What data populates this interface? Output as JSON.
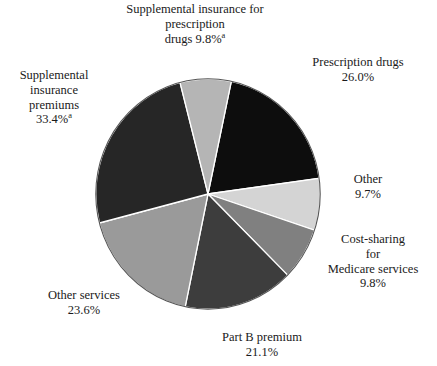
{
  "chart_data": {
    "type": "pie",
    "title": "",
    "subtitle": "",
    "xlabel": "",
    "ylabel": "",
    "legend_position": "none",
    "grid": false,
    "units": "percent",
    "start_angle_deg": 12,
    "direction": "clockwise",
    "categories": [
      "Prescription drugs",
      "Other",
      "Cost-sharing for Medicare services",
      "Part B premium",
      "Other services",
      "Supplemental insurance premiums",
      "Supplemental insurance for prescription drugs"
    ],
    "values": [
      26.0,
      9.7,
      9.8,
      21.1,
      23.6,
      33.4,
      9.8
    ],
    "colors": [
      "#0d0d0d",
      "#d4d4d4",
      "#808080",
      "#3d3d3d",
      "#9a9a9a",
      "#262626",
      "#b5b5b5"
    ],
    "footnote_markers": {
      "Supplemental insurance premiums": "a",
      "Supplemental insurance for prescription drugs": "a"
    },
    "slices": [
      {
        "name": "Prescription drugs",
        "value": 26.0,
        "value_label": "26.0%",
        "color": "#0d0d0d",
        "footnote": ""
      },
      {
        "name": "Other",
        "value": 9.7,
        "value_label": "9.7%",
        "color": "#d4d4d4",
        "footnote": ""
      },
      {
        "name": "Cost-sharing for Medicare services",
        "value": 9.8,
        "value_label": "9.8%",
        "color": "#808080",
        "footnote": ""
      },
      {
        "name": "Part B premium",
        "value": 21.1,
        "value_label": "21.1%",
        "color": "#3d3d3d",
        "footnote": ""
      },
      {
        "name": "Other services",
        "value": 23.6,
        "value_label": "23.6%",
        "color": "#9a9a9a",
        "footnote": ""
      },
      {
        "name": "Supplemental insurance premiums",
        "value": 33.4,
        "value_label": "33.4%",
        "color": "#262626",
        "footnote": "a"
      },
      {
        "name": "Supplemental insurance for prescription drugs",
        "value": 9.8,
        "value_label": "9.8%",
        "color": "#b5b5b5",
        "footnote": "a"
      }
    ]
  },
  "labels": {
    "supplemental_rx": {
      "line1": "Supplemental insurance for",
      "line2": "prescription",
      "line3": "drugs 9.8%",
      "sup": "a"
    },
    "prescription_drugs": {
      "line1": "Prescription drugs",
      "line2": "26.0%"
    },
    "supplemental_premiums": {
      "line1": "Supplemental",
      "line2": "insurance",
      "line3": "premiums",
      "line4": "33.4%",
      "sup": "a"
    },
    "other": {
      "line1": "Other",
      "line2": "9.7%"
    },
    "cost_sharing": {
      "line1": "Cost-sharing",
      "line2": "for",
      "line3": "Medicare services",
      "line4": "9.8%"
    },
    "other_services": {
      "line1": "Other services",
      "line2": "23.6%"
    },
    "part_b_premium": {
      "line1": "Part B premium",
      "line2": "21.1%"
    }
  }
}
